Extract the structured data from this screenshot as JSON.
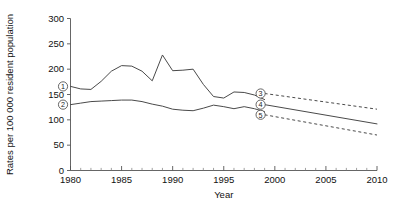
{
  "chart_data": {
    "type": "line",
    "title": "",
    "xlabel": "Year",
    "ylabel": "Rates per 100 000 resident population",
    "xlim": [
      1980,
      2010
    ],
    "ylim": [
      0,
      300
    ],
    "grid": false,
    "legend_position": "inline-markers",
    "x_ticks": [
      1980,
      1985,
      1990,
      1995,
      2000,
      2005,
      2010
    ],
    "x_tick_labels": [
      "1980",
      "1985",
      "1990",
      "1995",
      "2000",
      "2005",
      "2010"
    ],
    "x_minor_tick_interval": 1,
    "y_ticks": [
      0,
      50,
      100,
      150,
      200,
      250,
      300
    ],
    "y_tick_labels": [
      "0",
      "50",
      "100",
      "150",
      "200",
      "250",
      "300"
    ],
    "series": [
      {
        "name": "1",
        "marker_label": "1",
        "style": "solid",
        "x": [
          1980,
          1981,
          1982,
          1983,
          1984,
          1985,
          1986,
          1987,
          1988,
          1989,
          1990,
          1991,
          1992,
          1993,
          1994,
          1995,
          1996,
          1997,
          1998,
          1999
        ],
        "values": [
          166,
          161,
          160,
          176,
          196,
          207,
          206,
          196,
          177,
          228,
          197,
          198,
          200,
          170,
          146,
          143,
          155,
          154,
          149,
          140
        ]
      },
      {
        "name": "2",
        "marker_label": "2",
        "style": "solid",
        "x": [
          1980,
          1981,
          1982,
          1983,
          1984,
          1985,
          1986,
          1987,
          1988,
          1989,
          1990,
          1991,
          1992,
          1993,
          1994,
          1995,
          1996,
          1997,
          1998,
          1999
        ],
        "values": [
          130,
          133,
          136,
          137,
          138,
          139,
          139,
          136,
          131,
          127,
          121,
          119,
          118,
          123,
          129,
          126,
          122,
          126,
          122,
          116
        ]
      },
      {
        "name": "3",
        "marker_label": "3",
        "style": "dashed",
        "description": "upper projection bound",
        "x": [
          1999,
          2010
        ],
        "values": [
          152,
          121
        ]
      },
      {
        "name": "4",
        "marker_label": "4",
        "style": "solid",
        "description": "central projection",
        "x": [
          1999,
          2010
        ],
        "values": [
          130,
          92
        ]
      },
      {
        "name": "5",
        "marker_label": "5",
        "style": "dashed",
        "description": "lower projection bound",
        "x": [
          1999,
          2010
        ],
        "values": [
          110,
          70
        ]
      }
    ],
    "markers": [
      {
        "label": "1",
        "x": 1980.15,
        "y": 166,
        "offset_x": -9,
        "offset_y": 0
      },
      {
        "label": "2",
        "x": 1980.15,
        "y": 130,
        "offset_x": -9,
        "offset_y": 0
      },
      {
        "label": "3",
        "x": 1999.0,
        "y": 152,
        "offset_x": -4,
        "offset_y": 0
      },
      {
        "label": "4",
        "x": 1999.0,
        "y": 130,
        "offset_x": -4,
        "offset_y": 0
      },
      {
        "label": "5",
        "x": 1999.0,
        "y": 110,
        "offset_x": -4,
        "offset_y": 0
      }
    ],
    "colors": {
      "line": "#4a4a4a",
      "axis": "#555555",
      "text": "#111111",
      "background": "#ffffff"
    }
  }
}
